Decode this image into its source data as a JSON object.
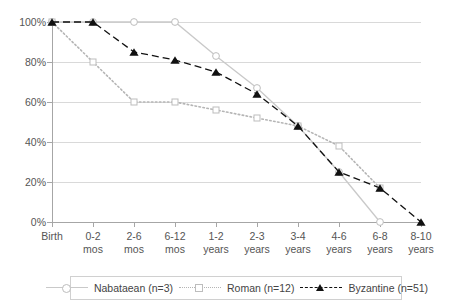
{
  "chart_data": {
    "type": "line",
    "title": "",
    "xlabel": "",
    "ylabel": "",
    "ylim": [
      0,
      100
    ],
    "ytick_labels": [
      "100%",
      "80%",
      "60%",
      "40%",
      "20%",
      "0%"
    ],
    "ytick_values": [
      100,
      80,
      60,
      40,
      20,
      0
    ],
    "grid": true,
    "legend_position": "bottom",
    "categories": [
      "Birth",
      "0-2 mos",
      "2-6 mos",
      "6-12 mos",
      "1-2 years",
      "2-3 years",
      "3-4 years",
      "4-6 years",
      "6-8 years",
      "8-10 years"
    ],
    "category_lines": [
      [
        "Birth",
        ""
      ],
      [
        "0-2",
        "mos"
      ],
      [
        "2-6",
        "mos"
      ],
      [
        "6-12",
        "mos"
      ],
      [
        "1-2",
        "years"
      ],
      [
        "2-3",
        "years"
      ],
      [
        "3-4",
        "years"
      ],
      [
        "4-6",
        "years"
      ],
      [
        "6-8",
        "years"
      ],
      [
        "8-10",
        "years"
      ]
    ],
    "series": [
      {
        "name": "Nabataean (n=3)",
        "marker": "open-circle",
        "line_style": "solid",
        "color": "#c9c9c9",
        "values": [
          100,
          100,
          100,
          100,
          83,
          67,
          48,
          25,
          0,
          null
        ]
      },
      {
        "name": "Roman (n=12)",
        "marker": "open-square",
        "line_style": "dotted",
        "color": "#b5b5b5",
        "values": [
          100,
          80,
          60,
          60,
          56,
          52,
          48,
          38,
          17,
          null
        ]
      },
      {
        "name": "Byzantine (n=51)",
        "marker": "filled-triangle",
        "line_style": "dashed",
        "color": "#111111",
        "values": [
          100,
          100,
          85,
          81,
          75,
          64,
          48,
          25,
          17,
          0
        ]
      }
    ]
  },
  "legend": {
    "items": [
      {
        "label": "Nabataean (n=3)",
        "marker": "open-circle",
        "style": "solid"
      },
      {
        "label": "Roman (n=12)",
        "marker": "open-square",
        "style": "dotted"
      },
      {
        "label": "Byzantine (n=51)",
        "marker": "filled-triangle",
        "style": "dashed"
      }
    ]
  }
}
